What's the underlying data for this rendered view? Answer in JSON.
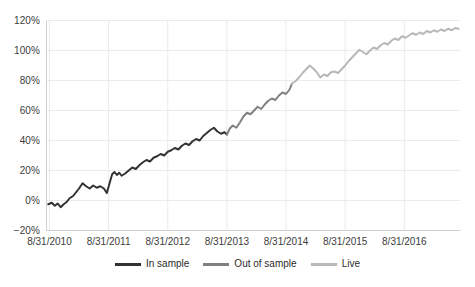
{
  "chart_data": {
    "type": "line",
    "title": "",
    "subtitle": "",
    "xlabel": "",
    "ylabel": "",
    "grid": true,
    "legend_position": "bottom",
    "ylim": [
      -20,
      120
    ],
    "ytick_labels": [
      "120%",
      "100%",
      "80%",
      "60%",
      "40%",
      "20%",
      "0%",
      "−20%"
    ],
    "ytick_values": [
      120,
      100,
      80,
      60,
      40,
      20,
      0,
      -20
    ],
    "xtick_labels": [
      "8/31/2010",
      "8/31/2011",
      "8/31/2012",
      "8/31/2013",
      "8/31/2014",
      "8/31/2015",
      "8/31/2016"
    ],
    "xtick_values": [
      0,
      1,
      2,
      3,
      4,
      5,
      6
    ],
    "xlim": [
      -0.05,
      6.95
    ],
    "unit": "percent cumulative return",
    "series": [
      {
        "name": "In sample",
        "color": "#333333",
        "x": [
          -0.02,
          0.04,
          0.09,
          0.14,
          0.19,
          0.24,
          0.29,
          0.34,
          0.4,
          0.45,
          0.5,
          0.56,
          0.62,
          0.68,
          0.74,
          0.8,
          0.86,
          0.92,
          0.97,
          1.02,
          1.06,
          1.1,
          1.14,
          1.18,
          1.22,
          1.28,
          1.34,
          1.4,
          1.46,
          1.52,
          1.58,
          1.64,
          1.7,
          1.76,
          1.82,
          1.88,
          1.94,
          2.0,
          2.06,
          2.12,
          2.18,
          2.24,
          2.3,
          2.36,
          2.42,
          2.48,
          2.54,
          2.6,
          2.66,
          2.72,
          2.78,
          2.84,
          2.9,
          2.96,
          3.0
        ],
        "y": [
          -2.5,
          -1.5,
          -3.5,
          -2.0,
          -4.5,
          -2.5,
          -1.0,
          1.5,
          3.0,
          5.5,
          8.0,
          11.5,
          9.5,
          8.0,
          10.0,
          8.5,
          9.5,
          8.0,
          5.0,
          12.0,
          17.5,
          19.0,
          17.0,
          18.5,
          16.5,
          18.0,
          20.0,
          22.0,
          21.0,
          23.5,
          25.5,
          27.0,
          26.0,
          28.5,
          29.5,
          31.0,
          30.0,
          32.5,
          33.5,
          35.0,
          34.0,
          36.5,
          38.0,
          37.0,
          39.5,
          41.0,
          40.0,
          43.0,
          45.0,
          47.0,
          48.5,
          46.0,
          44.5,
          45.5,
          44.0
        ]
      },
      {
        "name": "Out of sample",
        "color": "#808080",
        "x": [
          3.0,
          3.05,
          3.1,
          3.16,
          3.22,
          3.28,
          3.34,
          3.4,
          3.46,
          3.52,
          3.58,
          3.64,
          3.7,
          3.76,
          3.82,
          3.88,
          3.94,
          4.0,
          4.06,
          4.1
        ],
        "y": [
          44.0,
          48.0,
          50.0,
          48.5,
          52.0,
          56.0,
          58.5,
          57.5,
          60.0,
          62.5,
          61.0,
          64.0,
          66.5,
          68.0,
          67.0,
          70.0,
          72.0,
          71.0,
          74.0,
          78.0
        ]
      },
      {
        "name": "Live",
        "color": "#b8b8b8",
        "x": [
          4.1,
          4.16,
          4.22,
          4.28,
          4.34,
          4.4,
          4.46,
          4.52,
          4.58,
          4.64,
          4.7,
          4.76,
          4.82,
          4.88,
          4.94,
          5.0,
          5.06,
          5.12,
          5.18,
          5.24,
          5.3,
          5.36,
          5.42,
          5.48,
          5.54,
          5.6,
          5.66,
          5.72,
          5.78,
          5.84,
          5.9,
          5.96,
          6.02,
          6.08,
          6.14,
          6.2,
          6.26,
          6.32,
          6.38,
          6.44,
          6.5,
          6.56,
          6.62,
          6.68,
          6.74,
          6.8,
          6.86,
          6.92
        ],
        "y": [
          78.0,
          79.5,
          82.0,
          85.0,
          87.5,
          90.0,
          88.0,
          85.5,
          82.0,
          84.0,
          83.0,
          85.5,
          86.0,
          85.0,
          87.5,
          90.0,
          93.0,
          95.5,
          98.0,
          100.5,
          99.0,
          97.5,
          100.0,
          102.0,
          101.0,
          103.5,
          105.0,
          104.0,
          106.5,
          108.0,
          107.0,
          109.5,
          108.5,
          110.0,
          111.5,
          110.5,
          112.0,
          111.0,
          113.0,
          112.0,
          113.5,
          112.5,
          114.0,
          113.0,
          114.5,
          113.5,
          115.0,
          114.5
        ]
      }
    ],
    "legend": [
      {
        "label": "In sample",
        "color": "#333333"
      },
      {
        "label": "Out of sample",
        "color": "#808080"
      },
      {
        "label": "Live",
        "color": "#b8b8b8"
      }
    ]
  },
  "colors": {
    "in_sample": "#333333",
    "out_of_sample": "#808080",
    "live": "#b8b8b8",
    "grid": "#ebebeb",
    "axis": "#d0d0d0",
    "text": "#3c3c3c",
    "background": "#ffffff"
  }
}
